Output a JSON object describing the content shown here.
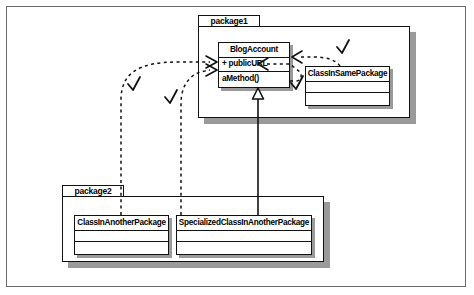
{
  "diagram": {
    "kind": "uml-class-diagram",
    "title": "",
    "frame_border_color": "#6b6b6b",
    "line_color": "#111111",
    "background": "#ffffff"
  },
  "packages": [
    {
      "id": "package1",
      "label": "package1",
      "x": 198,
      "y": 26,
      "w": 212,
      "h": 92,
      "tab": {
        "x": 198,
        "y": 15,
        "w": 62,
        "h": 12
      }
    },
    {
      "id": "package2",
      "label": "package2",
      "x": 62,
      "y": 196,
      "w": 262,
      "h": 66,
      "tab": {
        "x": 62,
        "y": 185,
        "w": 62,
        "h": 12
      }
    }
  ],
  "classes": [
    {
      "id": "blogaccount",
      "name": "BlogAccount",
      "x": 218,
      "y": 42,
      "w": 72,
      "h": 46,
      "compartments": [
        {
          "type": "name",
          "text": "BlogAccount"
        },
        {
          "type": "attribute",
          "text": "+ publicURL"
        },
        {
          "type": "operation",
          "text": "aMethod()"
        }
      ]
    },
    {
      "id": "classinsamepackage",
      "name": "ClassInSamePackage",
      "x": 305,
      "y": 66,
      "w": 85,
      "h": 40,
      "compartments": [
        {
          "type": "name",
          "text": "ClassInSamePackage"
        },
        {
          "type": "attribute",
          "text": ""
        },
        {
          "type": "operation",
          "text": ""
        }
      ]
    },
    {
      "id": "classinanotherpackage",
      "name": "ClassInAnotherPackage",
      "x": 74,
      "y": 215,
      "w": 95,
      "h": 40,
      "compartments": [
        {
          "type": "name",
          "text": "ClassInAnotherPackage"
        },
        {
          "type": "attribute",
          "text": ""
        },
        {
          "type": "operation",
          "text": ""
        }
      ]
    },
    {
      "id": "specializedclassinanotherpackage",
      "name": "SpecializedClassInAnotherPackage",
      "x": 176,
      "y": 215,
      "w": 136,
      "h": 40,
      "compartments": [
        {
          "type": "name",
          "text": "SpecializedClassInAnotherPackage"
        },
        {
          "type": "attribute",
          "text": ""
        },
        {
          "type": "operation",
          "text": ""
        }
      ]
    }
  ],
  "relationships": [
    {
      "id": "dep-classinanotherpackage-to-blogaccount",
      "type": "dependency",
      "style": "dashed",
      "from": "classinanotherpackage",
      "to": "blogaccount",
      "arrow": "open",
      "marked": true
    },
    {
      "id": "dep-specializedclass-to-blogaccount",
      "type": "dependency",
      "style": "dashed",
      "from": "specializedclassinanotherpackage",
      "to": "blogaccount",
      "arrow": "open",
      "marked": true
    },
    {
      "id": "dep-classinsamepackage-to-publicurl",
      "type": "dependency",
      "style": "dashed",
      "from": "classinsamepackage",
      "to": "blogaccount",
      "arrow": "open",
      "marked": true
    },
    {
      "id": "dep-blogaccount-to-classinsamepackage",
      "type": "dependency",
      "style": "dashed",
      "from": "blogaccount",
      "to": "classinsamepackage",
      "arrow": "open",
      "marked": true
    },
    {
      "id": "gen-specializedclass-to-blogaccount",
      "type": "generalization",
      "style": "solid",
      "from": "specializedclassinanotherpackage",
      "to": "blogaccount",
      "arrow": "hollow-triangle",
      "marked": false
    }
  ],
  "annotations": [
    {
      "id": "check-1",
      "glyph": "check",
      "x": 133,
      "y": 84
    },
    {
      "id": "check-2",
      "glyph": "check",
      "x": 170,
      "y": 97
    },
    {
      "id": "check-3",
      "glyph": "check",
      "x": 342,
      "y": 48
    },
    {
      "id": "check-4",
      "glyph": "check",
      "x": 296,
      "y": 84
    }
  ]
}
